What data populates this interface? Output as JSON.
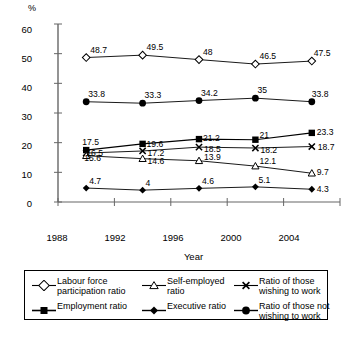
{
  "chart_data": {
    "type": "line",
    "title": "",
    "xlabel": "Year",
    "ylabel": "%",
    "categories": [
      "1988",
      "1992",
      "1996",
      "2000",
      "2004"
    ],
    "ylim": [
      0,
      60
    ],
    "yticks": [
      0,
      10,
      20,
      30,
      40,
      50,
      60
    ],
    "grid": false,
    "legend_position": "bottom",
    "series": [
      {
        "name": "Labour force participation ratio",
        "marker": "open-diamond",
        "values": [
          48.7,
          49.5,
          48,
          46.5,
          47.5
        ],
        "labels": [
          "48.7",
          "49.5",
          "48",
          "46.5",
          "47.5"
        ]
      },
      {
        "name": "Ratio of those not wishing to work",
        "marker": "filled-circle",
        "values": [
          33.8,
          33.3,
          34.2,
          35,
          33.8
        ],
        "labels": [
          "33.8",
          "33.3",
          "34.2",
          "35",
          "33.8"
        ]
      },
      {
        "name": "Employment ratio",
        "marker": "filled-square",
        "values": [
          17.5,
          19.6,
          21.2,
          21,
          23.3
        ],
        "labels": [
          "17.5",
          "19.6",
          "21.2",
          "21",
          "23.3"
        ]
      },
      {
        "name": "Ratio of those wishing to work",
        "marker": "cross-x",
        "values": [
          16.5,
          17.2,
          18.5,
          18.2,
          18.7
        ],
        "labels": [
          "16.5",
          "17.2",
          "18.5",
          "18.2",
          "18.7"
        ]
      },
      {
        "name": "Self-employed ratio",
        "marker": "open-triangle",
        "values": [
          15.6,
          14.6,
          13.9,
          12.1,
          9.7
        ],
        "labels": [
          "15.6",
          "14.6",
          "13.9",
          "12.1",
          "9.7"
        ]
      },
      {
        "name": "Executive ratio",
        "marker": "filled-diamond",
        "values": [
          4.7,
          4,
          4.6,
          5.1,
          4.3
        ],
        "labels": [
          "4.7",
          "4",
          "4.6",
          "5.1",
          "4.3"
        ]
      }
    ]
  },
  "axis": {
    "unit_label": "%",
    "x_title": "Year",
    "y_tick_labels": [
      "60",
      "50",
      "40",
      "30",
      "20",
      "10",
      "0"
    ],
    "x_tick_labels": [
      "1988",
      "1992",
      "1996",
      "2000",
      "2004"
    ]
  },
  "legend": {
    "entries": [
      {
        "label": "Labour force\nparticipation ratio",
        "marker": "open-diamond"
      },
      {
        "label": "Self-employed\nratio",
        "marker": "open-triangle"
      },
      {
        "label": "Ratio of those\nwishing to work",
        "marker": "cross-x"
      },
      {
        "label": "Employment ratio",
        "marker": "filled-square"
      },
      {
        "label": "Executive ratio",
        "marker": "filled-diamond"
      },
      {
        "label": "Ratio of those not\nwishing to work",
        "marker": "filled-circle"
      }
    ]
  },
  "colors": {
    "line": "#000000",
    "axis": "#666666",
    "text": "#000000",
    "background": "#ffffff"
  }
}
